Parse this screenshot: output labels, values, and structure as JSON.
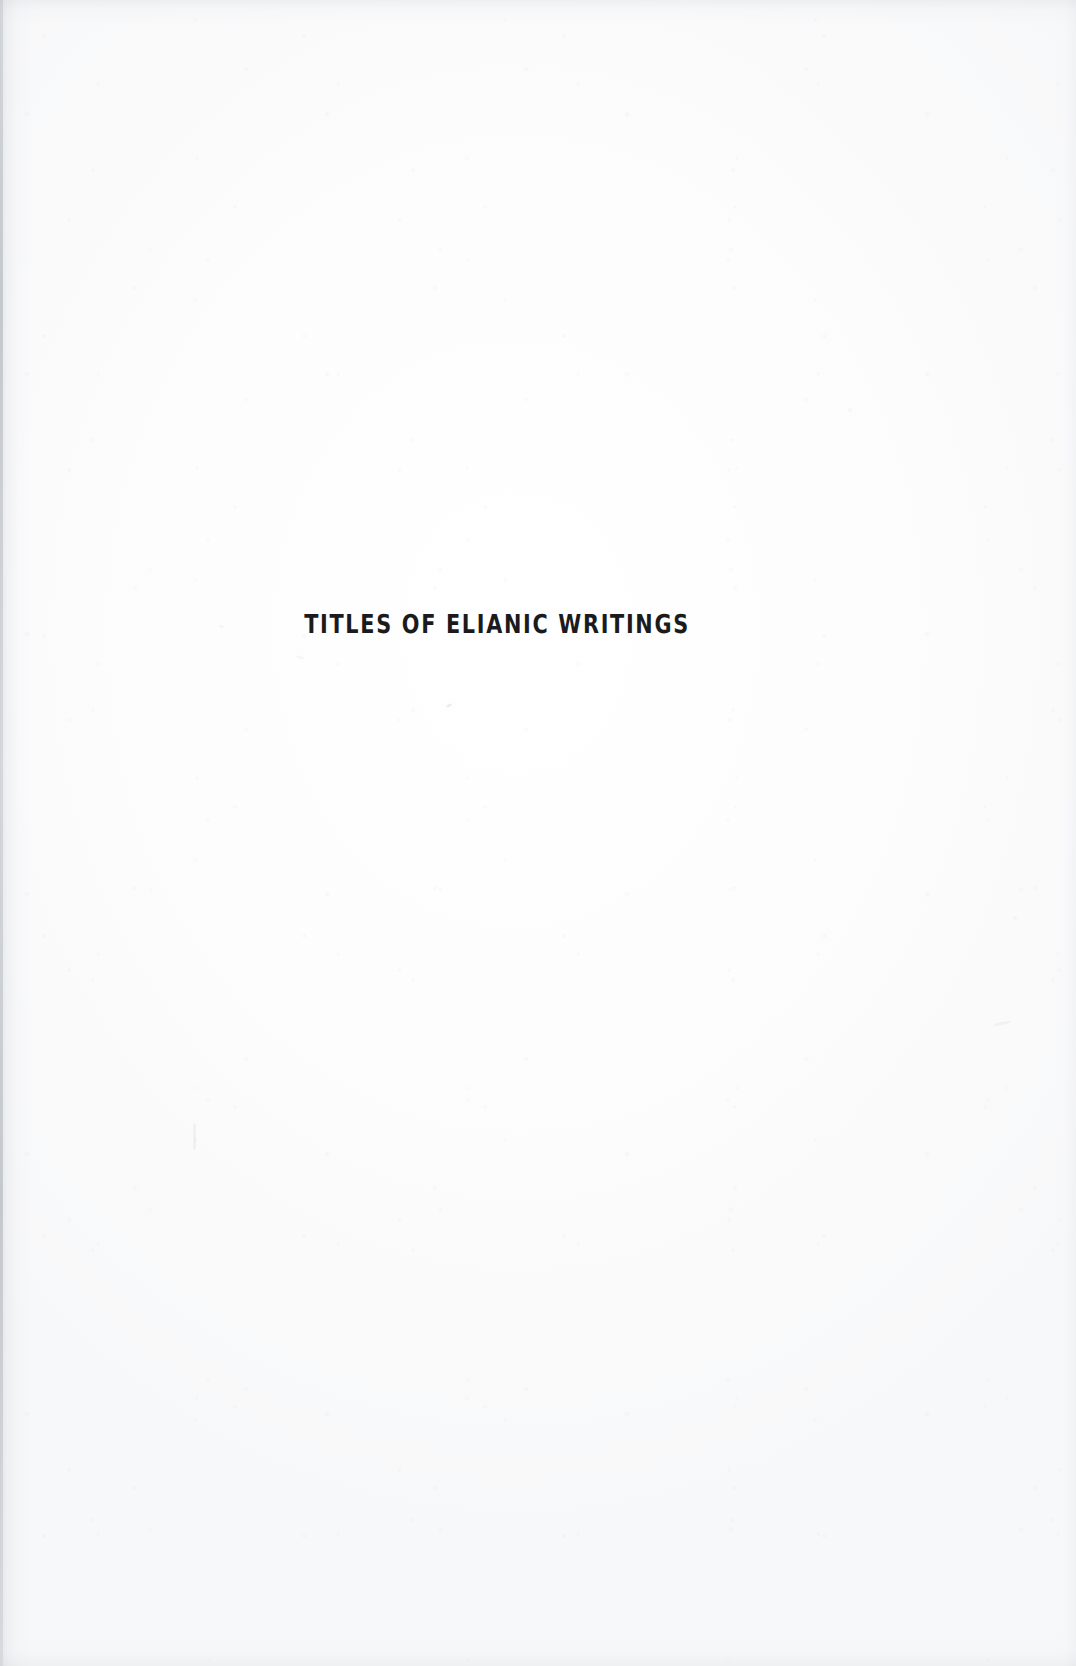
{
  "page": {
    "kind": "scanned-book-section-divider",
    "background_color": "#fbfbfc",
    "ink_color": "#1b1b1d",
    "width_px": 1076,
    "height_px": 1666
  },
  "content": {
    "section_title": "TITLES OF ELIANIC WRITINGS"
  },
  "marks": {
    "left_gutter_shadow": "present",
    "paper_grain": "present"
  }
}
